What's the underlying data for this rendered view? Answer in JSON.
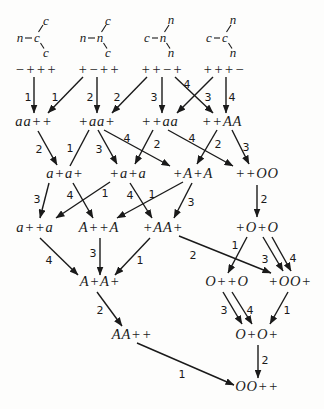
{
  "diagram": {
    "structures": [
      {
        "left": "n",
        "center": "c",
        "top": "c",
        "bottom": "c"
      },
      {
        "left": "n",
        "center": "n",
        "top": "c",
        "bottom": "c"
      },
      {
        "left": "c",
        "center": "n",
        "top": "n",
        "bottom": "n"
      },
      {
        "left": "c",
        "center": "c",
        "top": "n",
        "bottom": "n"
      }
    ],
    "nodes": [
      {
        "label": "−+++"
      },
      {
        "label": "+−++"
      },
      {
        "label": "++−+"
      },
      {
        "label": "+++−"
      },
      {
        "label": "aa++"
      },
      {
        "label": "+aa+"
      },
      {
        "label": "++aa"
      },
      {
        "label": "++AA"
      },
      {
        "label": "a+a+"
      },
      {
        "label": "+a+a"
      },
      {
        "label": "+A+A"
      },
      {
        "label": "++OO"
      },
      {
        "label": "a++a"
      },
      {
        "label": "A++A"
      },
      {
        "label": "+AA+"
      },
      {
        "label": "+O+O"
      },
      {
        "label": "A+A+"
      },
      {
        "label": "O++O"
      },
      {
        "label": "+OO+"
      },
      {
        "label": "AA++"
      },
      {
        "label": "O+O+"
      },
      {
        "label": "OO++"
      }
    ],
    "edges": [
      {
        "from": "−+++",
        "to": "aa++",
        "label": "1"
      },
      {
        "from": "+−++",
        "to": "aa++",
        "label": "1"
      },
      {
        "from": "+−++",
        "to": "+aa+",
        "label": "2"
      },
      {
        "from": "++−+",
        "to": "+aa+",
        "label": "2"
      },
      {
        "from": "++−+",
        "to": "++aa",
        "label": "3"
      },
      {
        "from": "++−+",
        "to": "++AA",
        "label": "4"
      },
      {
        "from": "+++−",
        "to": "++aa",
        "label": "3"
      },
      {
        "from": "+++−",
        "to": "++AA",
        "label": "4"
      },
      {
        "from": "aa++",
        "to": "a+a+",
        "label": "2"
      },
      {
        "from": "+aa+",
        "to": "a+a+",
        "label": "1"
      },
      {
        "from": "+aa+",
        "to": "+a+a",
        "label": "3"
      },
      {
        "from": "+aa+",
        "to": "+A+A",
        "label": "4"
      },
      {
        "from": "++aa",
        "to": "+a+a",
        "label": "2"
      },
      {
        "from": "++aa",
        "to": "++OO",
        "label": "4"
      },
      {
        "from": "++AA",
        "to": "+A+A",
        "label": "2"
      },
      {
        "from": "++AA",
        "to": "++OO",
        "label": "3"
      },
      {
        "from": "a+a+",
        "to": "a++a",
        "label": "3"
      },
      {
        "from": "a+a+",
        "to": "A++A",
        "label": "4"
      },
      {
        "from": "+a+a",
        "to": "a++a",
        "label": "1"
      },
      {
        "from": "+a+a",
        "to": "+AA+",
        "label": "4"
      },
      {
        "from": "+A+A",
        "to": "A++A",
        "label": "1"
      },
      {
        "from": "+A+A",
        "to": "+AA+",
        "label": "3"
      },
      {
        "from": "++OO",
        "to": "+O+O",
        "label": "2"
      },
      {
        "from": "a++a",
        "to": "A+A+",
        "label": "4"
      },
      {
        "from": "A++A",
        "to": "A+A+",
        "label": "3"
      },
      {
        "from": "+AA+",
        "to": "A+A+",
        "label": "1"
      },
      {
        "from": "+AA+",
        "to": "+OO+",
        "label": "2"
      },
      {
        "from": "+O+O",
        "to": "O++O",
        "label": "1"
      },
      {
        "from": "+O+O",
        "to": "+OO+",
        "label": "3"
      },
      {
        "from": "+O+O",
        "to": "+OO+",
        "label": "4"
      },
      {
        "from": "A+A+",
        "to": "AA++",
        "label": "2"
      },
      {
        "from": "O++O",
        "to": "O+O+",
        "label": "3"
      },
      {
        "from": "O++O",
        "to": "O+O+",
        "label": "4"
      },
      {
        "from": "+OO+",
        "to": "O+O+",
        "label": "1"
      },
      {
        "from": "AA++",
        "to": "OO++",
        "label": "1"
      },
      {
        "from": "O+O+",
        "to": "OO++",
        "label": "2"
      }
    ],
    "colors": {
      "ink": "#1a1a1a",
      "paper": "#fdfdfc"
    }
  }
}
